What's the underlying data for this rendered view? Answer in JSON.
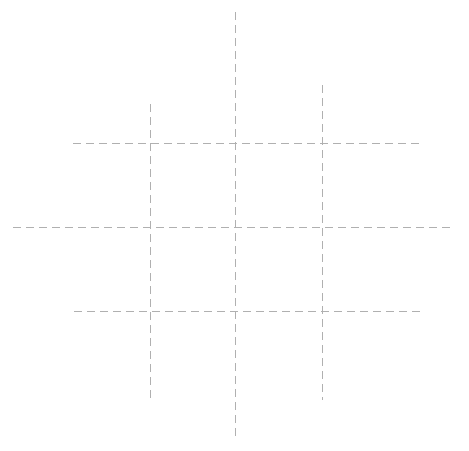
{
  "canvas": {
    "width": 469,
    "height": 451,
    "background_color": "#ffffff",
    "title": "Dashed Grid"
  },
  "style": {
    "stroke_color": "#b0b0b0",
    "stroke_width": 1,
    "dash_on": 8,
    "dash_off": 5,
    "line_cap": "butt"
  },
  "chart_data": {
    "type": "line",
    "subtitle": "",
    "xlabel": "",
    "ylabel": "",
    "grid": true,
    "legend": "none",
    "axis_ranges": {
      "x": [
        0,
        469
      ],
      "y": [
        0,
        451
      ]
    },
    "tick_labels": {
      "x": [],
      "y": []
    },
    "annotations": [],
    "series": [
      {
        "name": "vertical-line-left",
        "orientation": "vertical",
        "x": 150,
        "y_start": 104,
        "y_end": 400,
        "color": "#b0b0b0",
        "dash": [
          8,
          5
        ],
        "width": 1
      },
      {
        "name": "vertical-line-center",
        "orientation": "vertical",
        "x": 235,
        "y_start": 12,
        "y_end": 440,
        "color": "#b0b0b0",
        "dash": [
          8,
          5
        ],
        "width": 1
      },
      {
        "name": "vertical-line-right",
        "orientation": "vertical",
        "x": 322,
        "y_start": 85,
        "y_end": 400,
        "color": "#b0b0b0",
        "dash": [
          8,
          5
        ],
        "width": 1
      },
      {
        "name": "horizontal-line-top",
        "orientation": "horizontal",
        "y": 143,
        "x_start": 73,
        "x_end": 422,
        "color": "#b0b0b0",
        "dash": [
          8,
          5
        ],
        "width": 1
      },
      {
        "name": "horizontal-line-middle",
        "orientation": "horizontal",
        "y": 227,
        "x_start": 13,
        "x_end": 455,
        "color": "#b0b0b0",
        "dash": [
          8,
          5
        ],
        "width": 1
      },
      {
        "name": "horizontal-line-bottom",
        "orientation": "horizontal",
        "y": 311,
        "x_start": 74,
        "x_end": 422,
        "color": "#b0b0b0",
        "dash": [
          8,
          5
        ],
        "width": 1
      }
    ],
    "intersections": [
      {
        "x": 150,
        "y": 143
      },
      {
        "x": 235,
        "y": 143
      },
      {
        "x": 322,
        "y": 143
      },
      {
        "x": 150,
        "y": 227
      },
      {
        "x": 235,
        "y": 227
      },
      {
        "x": 322,
        "y": 227
      },
      {
        "x": 150,
        "y": 311
      },
      {
        "x": 235,
        "y": 311
      },
      {
        "x": 322,
        "y": 311
      }
    ]
  }
}
